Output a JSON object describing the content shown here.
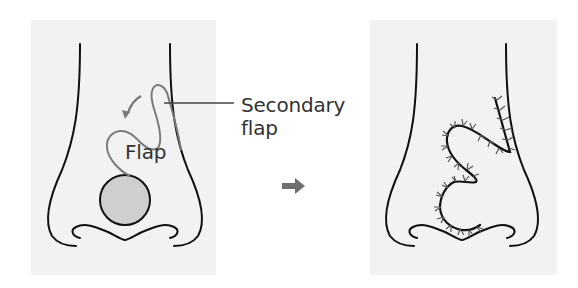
{
  "diagram": {
    "type": "surgical-flap-illustration",
    "panels": [
      {
        "id": "before",
        "description": "Nasal tip defect with bilobed flap design",
        "labels": {
          "flap": "Flap",
          "secondary_flap_line1": "Secondary",
          "secondary_flap_line2": "flap"
        },
        "elements": [
          "nose-outline",
          "circular-defect",
          "flap-outline",
          "rotation-arrow",
          "leader-line"
        ]
      },
      {
        "id": "after",
        "description": "Flap transposed and sutured",
        "elements": [
          "nose-outline",
          "sutured-incision-line"
        ]
      }
    ],
    "transition_arrow": "right-arrow",
    "colors": {
      "panel_background": "#f2f2f2",
      "outline": "#111111",
      "flap_outline": "#7a7a7a",
      "defect_fill": "#cfcfcf",
      "arrow": "#707070",
      "suture": "#555555",
      "text": "#333333"
    }
  }
}
